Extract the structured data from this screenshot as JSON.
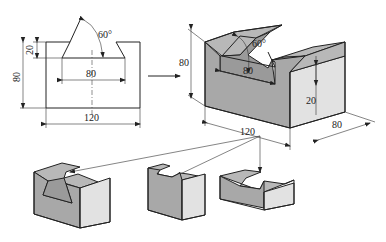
{
  "figure": {
    "type": "engineering-drawing",
    "front_view": {
      "angle_label": "60°",
      "notch_depth_label": "20",
      "height_label": "80",
      "notch_width_label": "80",
      "width_label": "120"
    },
    "isometric_view": {
      "height_label": "80",
      "angle_label": "60°",
      "notch_width_label": "80",
      "notch_depth_label": "20",
      "length_label": "120",
      "depth_label": "80"
    },
    "variants": [
      {
        "name": "deep-dovetail-block"
      },
      {
        "name": "tall-narrow-block"
      },
      {
        "name": "short-wide-block"
      }
    ]
  }
}
